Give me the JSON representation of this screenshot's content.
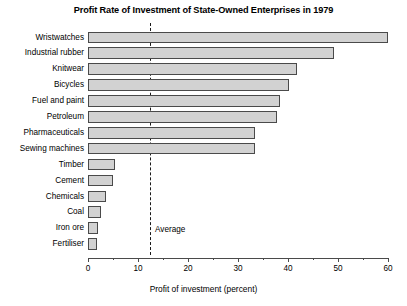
{
  "chart_data": {
    "type": "bar",
    "orientation": "horizontal",
    "title": "Profit Rate of Investment of State-Owned Enterprises in 1979",
    "xlabel": "Profit of investment (percent)",
    "ylabel": "",
    "xlim": [
      0,
      60
    ],
    "xticks": [
      0,
      10,
      20,
      30,
      40,
      50,
      60
    ],
    "xtick_labels": [
      "0",
      "10",
      "20",
      "30",
      "40",
      "50",
      "60"
    ],
    "minor_tick_step": 5,
    "grid": false,
    "legend": null,
    "categories": [
      "Wristwatches",
      "Industrial rubber",
      "Knitwear",
      "Bicycles",
      "Fuel and paint",
      "Petroleum",
      "Pharmaceuticals",
      "Sewing machines",
      "Timber",
      "Cement",
      "Chemicals",
      "Coal",
      "Iron ore",
      "Fertiliser"
    ],
    "values": [
      60.0,
      49.2,
      41.8,
      40.2,
      38.4,
      37.8,
      33.4,
      33.4,
      5.3,
      5.0,
      3.5,
      2.5,
      2.0,
      1.8
    ],
    "annotations": [
      {
        "name": "average-line",
        "label": "Average",
        "value": 12.4,
        "style": "dashed-vertical"
      }
    ],
    "colors": {
      "bar_fill": "#d2d2d2",
      "bar_edge": "#4a4a4a",
      "axis": "#4a4a4a",
      "text": "#000000",
      "background": "#ffffff",
      "average_line": "#1a1a1a"
    }
  }
}
